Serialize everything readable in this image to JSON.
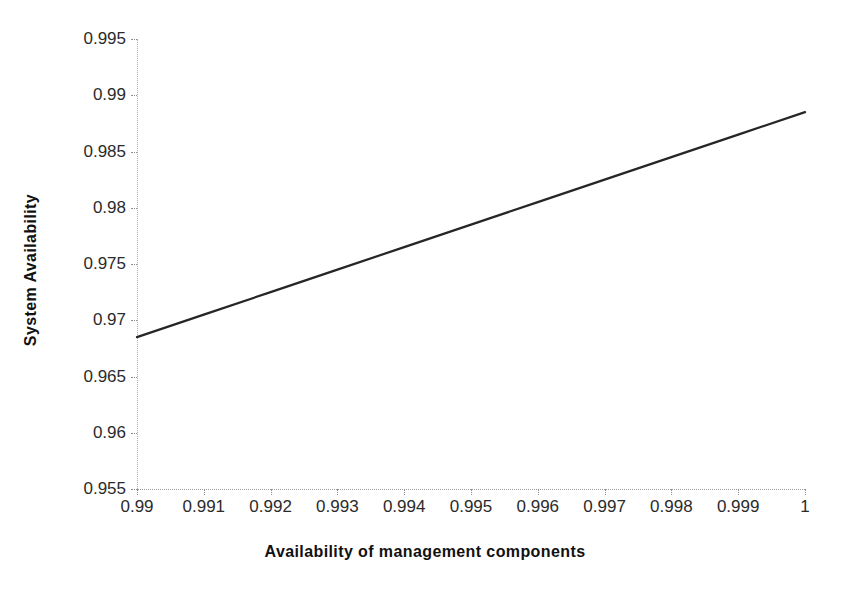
{
  "chart_data": {
    "type": "line",
    "title": "",
    "xlabel": "Availability of management components",
    "ylabel": "System Availability",
    "xlim": [
      0.99,
      1.0
    ],
    "ylim": [
      0.955,
      0.995
    ],
    "grid": false,
    "legend": false,
    "x_ticks": [
      "0.99",
      "0.991",
      "0.992",
      "0.993",
      "0.994",
      "0.995",
      "0.996",
      "0.997",
      "0.998",
      "0.999",
      "1"
    ],
    "x_tick_values": [
      0.99,
      0.991,
      0.992,
      0.993,
      0.994,
      0.995,
      0.996,
      0.997,
      0.998,
      0.999,
      1.0
    ],
    "y_ticks": [
      "0.995",
      "0.99",
      "0.985",
      "0.98",
      "0.975",
      "0.97",
      "0.965",
      "0.96",
      "0.955"
    ],
    "y_tick_values": [
      0.995,
      0.99,
      0.985,
      0.98,
      0.975,
      0.97,
      0.965,
      0.96,
      0.955
    ],
    "series": [
      {
        "name": "System Availability",
        "color": "#262626",
        "x": [
          0.99,
          0.991,
          0.992,
          0.993,
          0.994,
          0.995,
          0.996,
          0.997,
          0.998,
          0.999,
          1.0
        ],
        "values": [
          0.9685,
          0.9705,
          0.9725,
          0.9745,
          0.9765,
          0.9785,
          0.9805,
          0.9825,
          0.9845,
          0.9865,
          0.9885
        ]
      }
    ]
  },
  "colors": {
    "line": "#262626",
    "axis": "#9a9a9a",
    "text": "#2b2b2b",
    "background": "#ffffff"
  }
}
